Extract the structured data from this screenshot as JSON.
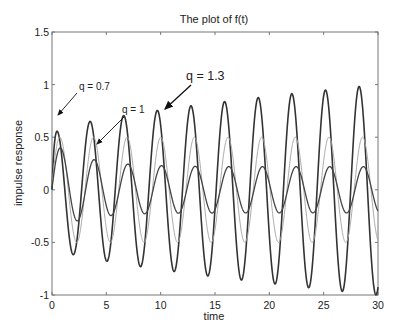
{
  "chart_data": {
    "type": "line",
    "title": "The plot of f(t)",
    "xlabel": "time",
    "ylabel": "impulse response",
    "xlim": [
      0,
      30
    ],
    "ylim": [
      -1,
      1.5
    ],
    "xticks": [
      0,
      5,
      10,
      15,
      20,
      25,
      30
    ],
    "yticks": [
      -1,
      -0.5,
      0,
      0.5,
      1,
      1.5
    ],
    "ytick_labels": [
      "-1",
      "-0.5",
      "0",
      "0.5",
      "1",
      "1.5"
    ],
    "grid": false,
    "legend": "none (annotated with arrows)",
    "series": [
      {
        "name": "q = 1.3",
        "color": "#333333",
        "width": 1.6,
        "model": {
          "omega": 2.03,
          "phase": 0.0,
          "amp_start": 0.55,
          "amp_end": 1.0,
          "amp_shape": "growing"
        },
        "peaks": [
          [
            0.4,
            0.68
          ],
          [
            3.7,
            0.56
          ],
          [
            6.8,
            0.66
          ],
          [
            10.1,
            0.74
          ],
          [
            13.2,
            0.8
          ],
          [
            16.3,
            0.86
          ],
          [
            19.5,
            0.9
          ],
          [
            22.6,
            0.95
          ],
          [
            25.8,
            0.99
          ],
          [
            28.8,
            1.02
          ]
        ],
        "troughs": [
          [
            2.4,
            -0.47
          ],
          [
            5.8,
            -0.62
          ],
          [
            8.9,
            -0.72
          ],
          [
            27.8,
            -0.98
          ]
        ]
      },
      {
        "name": "q = 1",
        "color": "#aaaaaa",
        "width": 1.0,
        "model": {
          "omega": 2.03,
          "phase": 0.0,
          "amp_start": 0.5,
          "amp_end": 0.5,
          "amp_shape": "constant"
        },
        "peaks": [
          [
            0.8,
            0.5
          ],
          [
            3.9,
            0.5
          ],
          [
            7.0,
            0.5
          ],
          [
            10.1,
            0.5
          ],
          [
            29.0,
            0.5
          ]
        ],
        "troughs": [
          [
            2.3,
            -0.5
          ],
          [
            5.4,
            -0.5
          ],
          [
            28.0,
            -0.5
          ]
        ]
      },
      {
        "name": "q = 0.7",
        "color": "#444444",
        "width": 1.3,
        "model": {
          "omega": 2.03,
          "phase": -0.55,
          "amp_start": 0.42,
          "amp_end": 0.22,
          "amp_shape": "decaying"
        },
        "peaks": [
          [
            1.1,
            0.37
          ],
          [
            3.6,
            0.4
          ],
          [
            6.6,
            0.33
          ],
          [
            29.0,
            0.22
          ]
        ],
        "troughs": [
          [
            2.2,
            -0.47
          ],
          [
            5.3,
            -0.34
          ],
          [
            8.4,
            -0.28
          ],
          [
            28.0,
            -0.22
          ]
        ]
      }
    ],
    "annotations": [
      {
        "text": "q = 0.7",
        "label_xy": [
          77,
          90
        ],
        "arrow_from": [
          77,
          93
        ],
        "arrow_to": [
          57,
          116
        ]
      },
      {
        "text": "q = 1",
        "label_xy": [
          122,
          113
        ],
        "arrow_from": [
          124,
          117
        ],
        "arrow_to": [
          96,
          145
        ]
      },
      {
        "text": "q = 1.3",
        "label_xy": [
          185,
          80
        ],
        "arrow_from": [
          190,
          84
        ],
        "arrow_to": [
          164,
          110
        ]
      }
    ]
  },
  "labels": {
    "title": "The plot of f(t)",
    "xlabel": "time",
    "ylabel": "impulse response",
    "ann_q07": "q = 0.7",
    "ann_q1": "q = 1",
    "ann_q13": "q = 1.3"
  }
}
